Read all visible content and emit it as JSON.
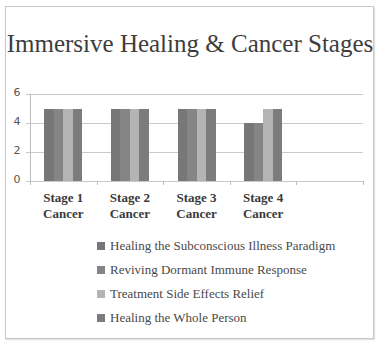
{
  "chart_data": {
    "type": "bar",
    "title": "Immersive Healing & Cancer Stages",
    "xlabel": "",
    "ylabel": "",
    "ylim": [
      0,
      6
    ],
    "yticks": [
      "0",
      "2",
      "4",
      "6"
    ],
    "grid": true,
    "legend_position": "bottom",
    "categories": [
      "Stage 1 Cancer",
      "Stage 2 Cancer",
      "Stage 3 Cancer",
      "Stage 4 Cancer"
    ],
    "category_lines": [
      [
        "Stage 1",
        "Cancer"
      ],
      [
        "Stage 2",
        "Cancer"
      ],
      [
        "Stage 3",
        "Cancer"
      ],
      [
        "Stage 4",
        "Cancer"
      ]
    ],
    "series": [
      {
        "name": "Healing the Subconscious Illness Paradigm",
        "values": [
          5,
          5,
          5,
          4
        ],
        "color": "#777777"
      },
      {
        "name": "Reviving Dormant Immune Response",
        "values": [
          5,
          5,
          5,
          4
        ],
        "color": "#858585"
      },
      {
        "name": "Treatment Side Effects Relief",
        "values": [
          5,
          5,
          5,
          5
        ],
        "color": "#b4b4b4"
      },
      {
        "name": "Healing the Whole Person",
        "values": [
          5,
          5,
          5,
          5
        ],
        "color": "#7c7c7c"
      }
    ]
  }
}
